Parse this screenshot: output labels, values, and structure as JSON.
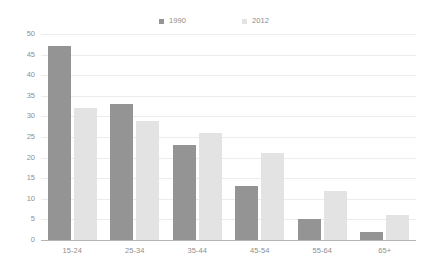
{
  "chart_data": {
    "type": "bar",
    "title": "",
    "subtitle": "",
    "xlabel": "",
    "ylabel": "",
    "categories": [
      "15-24",
      "25-34",
      "35-44",
      "45-54",
      "55-64",
      "65+"
    ],
    "series": [
      {
        "name": "1990",
        "color": "#949494",
        "values": [
          47,
          33,
          23,
          13,
          5,
          2
        ]
      },
      {
        "name": "2012",
        "color": "#e3e3e3",
        "values": [
          32,
          29,
          26,
          21,
          12,
          6
        ]
      }
    ],
    "ylim": [
      0,
      50
    ],
    "ytick_step": 5,
    "yticks": [
      "50",
      "45",
      "40",
      "35",
      "30",
      "25",
      "20",
      "15",
      "10",
      "5",
      "0"
    ],
    "grid": true,
    "grid_color": "#ececec",
    "legend_position": "top-center",
    "axis_color": "#b4b4b4",
    "background": "#ffffff"
  },
  "legend": {
    "entries": [
      {
        "label": "1990",
        "color": "#949494"
      },
      {
        "label": "2012",
        "color": "#e3e3e3"
      }
    ]
  }
}
